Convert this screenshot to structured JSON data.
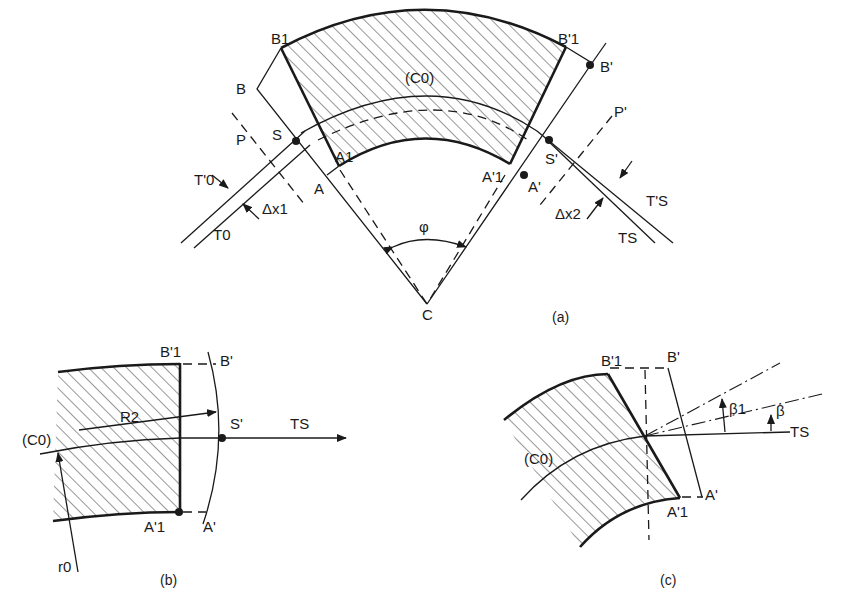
{
  "figure": {
    "panels": [
      {
        "id": "a",
        "caption": "(a)",
        "labels": {
          "B1": "B1",
          "B": "B",
          "B1p": "B'1",
          "Bp": "B'",
          "C0": "(C0)",
          "S": "S",
          "Sp": "S'",
          "P": "P",
          "Pp": "P'",
          "A": "A",
          "A1": "A1",
          "A1p": "A'1",
          "Ap": "A'",
          "T0p": "T'0",
          "T0": "T0",
          "dx1": "Δx1",
          "dx2": "Δx2",
          "TSp": "T'S",
          "TS": "TS",
          "phi": "φ",
          "C": "C"
        }
      },
      {
        "id": "b",
        "caption": "(b)",
        "labels": {
          "B1p": "B'1",
          "Bp": "B'",
          "R2": "R2",
          "C0": "(C0)",
          "Sp": "S'",
          "TS": "TS",
          "A1p": "A'1",
          "Ap": "A'",
          "r0": "r0"
        }
      },
      {
        "id": "c",
        "caption": "(c)",
        "labels": {
          "B1p": "B'1",
          "Bp": "B'",
          "beta1": "β1",
          "beta": "β",
          "TS": "TS",
          "C0": "(C0)",
          "A1p": "A'1",
          "Ap": "A'"
        }
      }
    ]
  }
}
